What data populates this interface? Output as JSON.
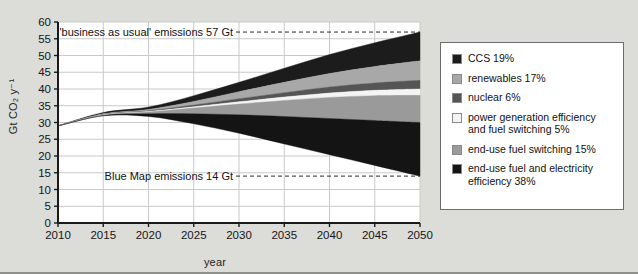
{
  "chart_data": {
    "type": "area",
    "title": "",
    "xlabel": "year",
    "ylabel": "Gt CO₂ y⁻¹",
    "xlim": [
      2010,
      2050
    ],
    "ylim": [
      0,
      60
    ],
    "xticks": [
      "2010",
      "2015",
      "2020",
      "2025",
      "2030",
      "2035",
      "2040",
      "2045",
      "2050"
    ],
    "yticks": [
      "0",
      "5",
      "10",
      "15",
      "20",
      "25",
      "30",
      "35",
      "40",
      "45",
      "50",
      "55",
      "60"
    ],
    "grid": true,
    "legend_position": "right-outside",
    "x": [
      2010,
      2015,
      2020,
      2025,
      2030,
      2035,
      2040,
      2045,
      2050
    ],
    "baseline_top_name": "'business as usual' emissions",
    "baseline_top_values": [
      29.0,
      33.0,
      34.6,
      38.0,
      42.0,
      46.2,
      50.3,
      53.8,
      57.0
    ],
    "baseline_bottom_name": "Blue Map emissions",
    "baseline_bottom_values": [
      29.0,
      32.0,
      31.8,
      29.6,
      26.8,
      23.6,
      20.4,
      17.2,
      14.0
    ],
    "series": [
      {
        "name": "CCS",
        "share": "19%",
        "color": "#1c1c1c",
        "upper": [
          29.0,
          33.0,
          34.6,
          38.0,
          42.0,
          46.2,
          50.3,
          53.8,
          57.0
        ],
        "lower": [
          29.0,
          32.6,
          33.9,
          36.3,
          39.2,
          42.0,
          44.6,
          46.7,
          48.4
        ]
      },
      {
        "name": "renewables",
        "share": "17%",
        "color": "#a8a8a8",
        "upper": [
          29.0,
          32.6,
          33.9,
          36.3,
          39.2,
          42.0,
          44.6,
          46.7,
          48.4
        ],
        "lower": [
          29.0,
          32.4,
          33.5,
          35.2,
          37.1,
          38.9,
          40.6,
          41.8,
          42.6
        ]
      },
      {
        "name": "nuclear",
        "share": "6%",
        "color": "#555555",
        "upper": [
          29.0,
          32.4,
          33.5,
          35.2,
          37.1,
          38.9,
          40.6,
          41.8,
          42.6
        ],
        "lower": [
          29.0,
          32.3,
          33.3,
          34.7,
          36.2,
          37.6,
          38.8,
          39.6,
          40.0
        ]
      },
      {
        "name": "power generation efficiency and fuel switching",
        "share": "5%",
        "color": "#f4f4f4",
        "upper": [
          29.0,
          32.3,
          33.3,
          34.7,
          36.2,
          37.6,
          38.8,
          39.6,
          40.0
        ],
        "lower": [
          29.0,
          32.2,
          33.1,
          34.3,
          35.5,
          36.6,
          37.5,
          38.0,
          38.1
        ]
      },
      {
        "name": "end-use fuel switching",
        "share": "15%",
        "color": "#9a9a9a",
        "upper": [
          29.0,
          32.2,
          33.1,
          34.3,
          35.5,
          36.6,
          37.5,
          38.0,
          38.1
        ],
        "lower": [
          29.0,
          32.1,
          32.6,
          32.6,
          32.3,
          31.8,
          31.2,
          30.6,
          30.0
        ]
      },
      {
        "name": "end-use fuel and electricity efficiency",
        "share": "38%",
        "color": "#141414",
        "upper": [
          29.0,
          32.1,
          32.6,
          32.6,
          32.3,
          31.8,
          31.2,
          30.6,
          30.0
        ],
        "lower": [
          29.0,
          32.0,
          31.8,
          29.6,
          26.8,
          23.6,
          20.4,
          17.2,
          14.0
        ]
      }
    ],
    "annotations": [
      {
        "text": "'business as usual' emissions 57 Gt",
        "value": 57,
        "at_year": 2050
      },
      {
        "text": "Blue Map emissions 14 Gt",
        "value": 14,
        "at_year": 2050
      }
    ]
  },
  "legend": {
    "items": [
      {
        "label": "CCS 19%",
        "color": "#1c1c1c"
      },
      {
        "label": "renewables 17%",
        "color": "#a8a8a8"
      },
      {
        "label": "nuclear 6%",
        "color": "#555555"
      },
      {
        "label": "power generation efficiency and fuel switching 5%",
        "color": "#f4f4f4"
      },
      {
        "label": "end-use fuel switching 15%",
        "color": "#9a9a9a"
      },
      {
        "label": "end-use fuel and electricity efficiency 38%",
        "color": "#141414"
      }
    ]
  }
}
